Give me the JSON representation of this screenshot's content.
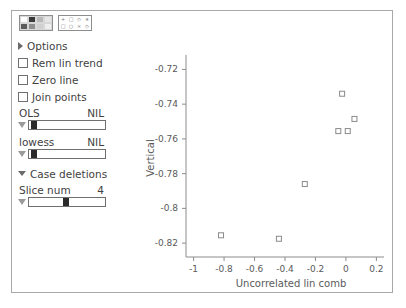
{
  "window": {
    "title": ""
  },
  "toolbar": {
    "palette_icon": "palette-icon",
    "glyph_icon": "glyph-icon",
    "palette_cells": [
      "#ffffff",
      "#3a3a3a",
      "#b8b8b8",
      "#e6e6e6",
      "#5c5c5c",
      "#8f8f8f",
      "#d0d0d0",
      "#efefef"
    ],
    "glyph_cells": [
      "+",
      "□",
      "◇",
      "∗",
      "□",
      "○",
      "×",
      "◇"
    ]
  },
  "controls": {
    "options_label": "Options",
    "checkboxes": [
      {
        "label": "Rem lin trend",
        "checked": false
      },
      {
        "label": "Zero line",
        "checked": false
      },
      {
        "label": "Join points",
        "checked": false
      }
    ],
    "sliders": [
      {
        "name": "OLS",
        "value": "NIL",
        "thumb_pct": 3
      },
      {
        "name": "lowess",
        "value": "NIL",
        "thumb_pct": 3
      }
    ],
    "case_deletions_label": "Case deletions",
    "slice": {
      "name": "Slice num",
      "value": "4",
      "thumb_pct": 45
    }
  },
  "chart_data": {
    "type": "scatter",
    "title": "",
    "xlabel": "Uncorrelated lin comb",
    "ylabel": "Vertical",
    "xlim": [
      -1.05,
      0.25
    ],
    "ylim": [
      -0.828,
      -0.714
    ],
    "xticks": [
      -1,
      -0.8,
      -0.6,
      -0.4,
      -0.2,
      0,
      0.2
    ],
    "xticklabels": [
      "-1",
      "-0.8",
      "-0.6",
      "-0.4",
      "-0.2",
      "0",
      "0.2"
    ],
    "yticks": [
      -0.72,
      -0.74,
      -0.76,
      -0.78,
      -0.8,
      -0.82
    ],
    "yticklabels": [
      "-0.72",
      "-0.74",
      "-0.76",
      "-0.78",
      "-0.8",
      "-0.82"
    ],
    "grid": false,
    "legend": null,
    "marker": "open-square",
    "marker_color": "#8a8a8a",
    "points": [
      {
        "x": -0.82,
        "y": -0.8155
      },
      {
        "x": -0.44,
        "y": -0.8175
      },
      {
        "x": -0.27,
        "y": -0.786
      },
      {
        "x": -0.05,
        "y": -0.7555
      },
      {
        "x": 0.012,
        "y": -0.7555
      },
      {
        "x": 0.056,
        "y": -0.7485
      },
      {
        "x": -0.025,
        "y": -0.734
      }
    ]
  }
}
